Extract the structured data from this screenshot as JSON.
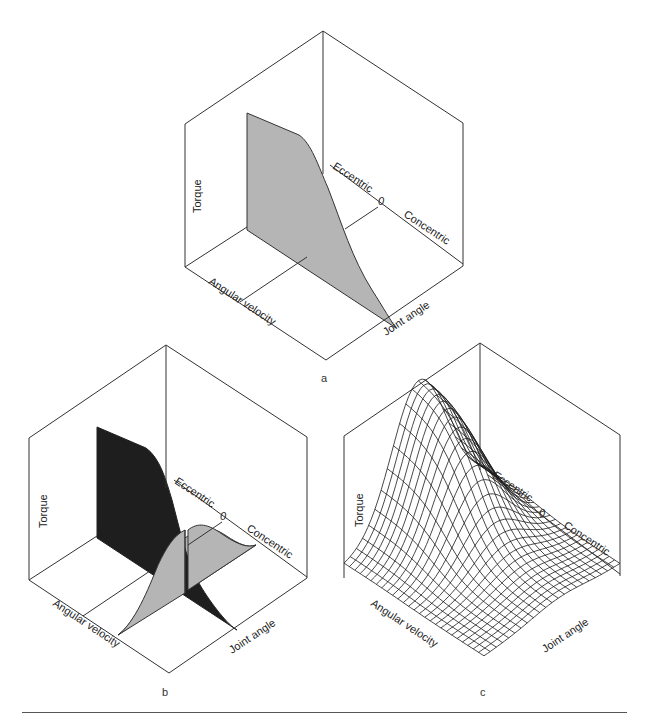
{
  "figure": {
    "panels": [
      {
        "id": "a",
        "label": "a",
        "surface_style": "single-gray-sheet",
        "axis_labels": {
          "torque": "Torque",
          "angular_velocity": "Angular velocity",
          "joint_angle": "Joint angle",
          "eccentric": "Eccentric",
          "zero": "0",
          "concentric": "Concentric"
        }
      },
      {
        "id": "b",
        "label": "b",
        "surface_style": "dark-sheet-and-gray-curve",
        "axis_labels": {
          "torque": "Torque",
          "angular_velocity": "Angular velocity",
          "joint_angle": "Joint angle",
          "eccentric": "Eccentric",
          "zero": "0",
          "concentric": "Concentric"
        }
      },
      {
        "id": "c",
        "label": "c",
        "surface_style": "wireframe-mesh",
        "axis_labels": {
          "torque": "Torque",
          "angular_velocity": "Angular velocity",
          "joint_angle": "Joint angle",
          "eccentric": "Eccentric",
          "zero": "0",
          "concentric": "Concentric"
        }
      }
    ],
    "colors": {
      "line": "#333333",
      "gray_fill": "#b5b5b5",
      "dark_fill": "#1e1e1e",
      "mesh": "#1a1a1a"
    }
  }
}
